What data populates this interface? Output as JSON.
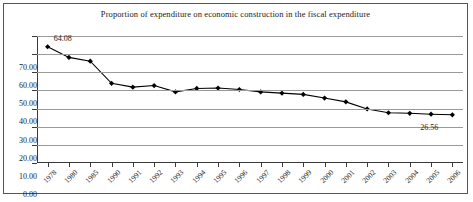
{
  "chart_data": {
    "type": "line",
    "title": "Proportion of expenditure on economic construction in the fiscal expenditure",
    "xlabel": "",
    "ylabel": "",
    "ylim": [
      0,
      70
    ],
    "ytick_step": 10,
    "grid": true,
    "legend": "none",
    "marker": "diamond",
    "line_color": "#000000",
    "marker_color": "#000000",
    "gridline_color": "#9a9a9a",
    "categories": [
      "1978",
      "1980",
      "1985",
      "1990",
      "1991",
      "1992",
      "1993",
      "1994",
      "1995",
      "1996",
      "1997",
      "1998",
      "1999",
      "2000",
      "2001",
      "2002",
      "2003",
      "2004",
      "2005",
      "2006"
    ],
    "values": [
      64.08,
      58.2,
      56.1,
      43.9,
      41.8,
      42.7,
      39.2,
      41.1,
      41.3,
      40.5,
      39.2,
      38.5,
      37.8,
      35.8,
      33.7,
      29.8,
      27.7,
      27.4,
      26.9,
      26.56
    ],
    "ytick_labels": [
      "70.00",
      "60.00",
      "50.00",
      "40.00",
      "30.00",
      "20.00",
      "10.00",
      "0.00"
    ],
    "annotations": [
      {
        "name": "first-point-label",
        "text": "64.08",
        "category": "1978",
        "value": 64.08
      },
      {
        "name": "last-point-label",
        "text": "26.56",
        "category": "2006",
        "value": 26.56
      }
    ]
  }
}
